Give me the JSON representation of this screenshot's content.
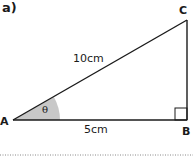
{
  "question": {
    "part_label": "a)"
  },
  "triangle": {
    "vertices": {
      "A": {
        "label": "A",
        "x": 13,
        "y": 120
      },
      "B": {
        "label": "B",
        "x": 187,
        "y": 120
      },
      "C": {
        "label": "C",
        "x": 187,
        "y": 20
      }
    },
    "sides": {
      "hypotenuse_AC": "10cm",
      "base_AB": "5cm"
    },
    "angle": {
      "at": "A",
      "symbol": "θ",
      "fill_color": "#c8c8c8"
    },
    "right_angle_at": "B",
    "line_color": "#1a1a1a"
  },
  "answer_line": {
    "style": "dotted",
    "color": "#888888"
  }
}
